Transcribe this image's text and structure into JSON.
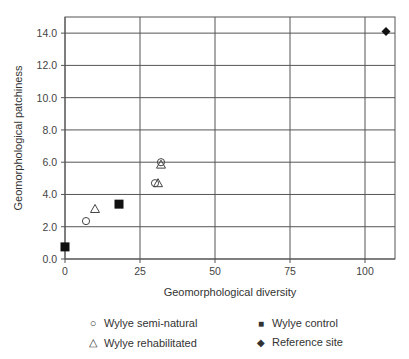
{
  "chart_data": {
    "type": "scatter",
    "title": "",
    "xlabel": "Geomorphological diversity",
    "ylabel": "Geomorphological patchiness",
    "xlim": [
      0,
      110
    ],
    "ylim": [
      0,
      15
    ],
    "xticks": [
      "0",
      "25",
      "50",
      "75",
      "100"
    ],
    "yticks": [
      "0.0",
      "2.0",
      "4.0",
      "6.0",
      "8.0",
      "10.0",
      "12.0",
      "14.0"
    ],
    "grid": true,
    "legend_position": "bottom",
    "series": [
      {
        "name": "Wylye semi-natural",
        "marker": "circle-open",
        "points": [
          {
            "x": 7,
            "y": 2.35
          },
          {
            "x": 30,
            "y": 4.7
          },
          {
            "x": 32,
            "y": 6.0
          }
        ]
      },
      {
        "name": "Wylye rehabilitated",
        "marker": "triangle-open",
        "points": [
          {
            "x": 10,
            "y": 3.1
          },
          {
            "x": 31,
            "y": 4.7
          },
          {
            "x": 32,
            "y": 5.85
          }
        ]
      },
      {
        "name": "Wylye control",
        "marker": "square-filled",
        "points": [
          {
            "x": 0,
            "y": 0.75
          },
          {
            "x": 18,
            "y": 3.4
          }
        ]
      },
      {
        "name": "Reference site",
        "marker": "diamond-filled",
        "points": [
          {
            "x": 107,
            "y": 14.1
          }
        ]
      }
    ]
  },
  "legend": {
    "semi_natural": "Wylye semi-natural",
    "rehabilitated": "Wylye rehabilitated",
    "control": "Wylye control",
    "reference": "Reference site"
  },
  "legend_symbols": {
    "semi_natural": "○",
    "rehabilitated": "△",
    "control": "■",
    "reference": "◆"
  }
}
